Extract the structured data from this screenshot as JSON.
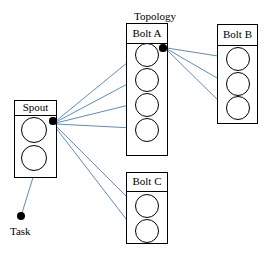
{
  "diagram": {
    "title": "Topology",
    "canvas": {
      "width": 271,
      "height": 256
    },
    "colors": {
      "stroke": "#000000",
      "arrow": "#4a7fb5",
      "background": "#ffffff",
      "port": "#000000"
    },
    "nodes": [
      {
        "id": "spout",
        "label": "Spout",
        "type": "spout",
        "box": {
          "x": 14,
          "y": 100,
          "w": 43,
          "h": 78
        },
        "header_h": 14,
        "slots": 2,
        "slot_positions": [
          {
            "cx": 34,
            "cy": 130,
            "r": 13
          },
          {
            "cx": 34,
            "cy": 158,
            "r": 13
          }
        ],
        "port": {
          "cx": 53,
          "cy": 121,
          "r": 3.6
        }
      },
      {
        "id": "bolt-a",
        "label": "Bolt A",
        "type": "bolt",
        "box": {
          "x": 126,
          "y": 23,
          "w": 42,
          "h": 133
        },
        "header_h": 19,
        "slots": 4,
        "slot_positions": [
          {
            "cx": 147,
            "cy": 55,
            "r": 12
          },
          {
            "cx": 147,
            "cy": 80,
            "r": 12
          },
          {
            "cx": 147,
            "cy": 105,
            "r": 12
          },
          {
            "cx": 147,
            "cy": 130,
            "r": 12
          }
        ],
        "port": {
          "cx": 163,
          "cy": 48,
          "r": 3.6
        }
      },
      {
        "id": "bolt-b",
        "label": "Bolt B",
        "type": "bolt",
        "box": {
          "x": 217,
          "y": 24,
          "w": 41,
          "h": 100
        },
        "header_h": 20,
        "slots": 3,
        "slot_positions": [
          {
            "cx": 238,
            "cy": 59,
            "r": 12
          },
          {
            "cx": 238,
            "cy": 84,
            "r": 12
          },
          {
            "cx": 238,
            "cy": 108,
            "r": 12
          }
        ],
        "port": null
      },
      {
        "id": "bolt-c",
        "label": "Bolt C",
        "type": "bolt",
        "box": {
          "x": 126,
          "y": 172,
          "w": 42,
          "h": 72
        },
        "header_h": 18,
        "slots": 2,
        "slot_positions": [
          {
            "cx": 147,
            "cy": 206,
            "r": 12
          },
          {
            "cx": 147,
            "cy": 231,
            "r": 12
          }
        ],
        "port": null
      }
    ],
    "task": {
      "label": "Task",
      "dot": {
        "cx": 21,
        "cy": 216,
        "r": 4.4
      },
      "label_pos": {
        "x": 10,
        "y": 226
      },
      "leader_from": {
        "x": 35,
        "y": 171
      },
      "leader_to": {
        "x": 22,
        "y": 213
      }
    },
    "title_pos": {
      "x": 124,
      "y": 11,
      "w": 62
    },
    "edges": [
      {
        "from": "spout-port",
        "to": "bolt-a-slot-1",
        "x1": 56,
        "y1": 121,
        "x2": 133,
        "y2": 58
      },
      {
        "from": "spout-port",
        "to": "bolt-a-slot-2",
        "x1": 56,
        "y1": 122,
        "x2": 133,
        "y2": 81
      },
      {
        "from": "spout-port",
        "to": "bolt-a-slot-3",
        "x1": 56,
        "y1": 123,
        "x2": 133,
        "y2": 104
      },
      {
        "from": "spout-port",
        "to": "bolt-a-slot-4",
        "x1": 56,
        "y1": 124,
        "x2": 133,
        "y2": 128
      },
      {
        "from": "spout-port",
        "to": "bolt-c-slot-1",
        "x1": 56,
        "y1": 126,
        "x2": 133,
        "y2": 203
      },
      {
        "from": "spout-port",
        "to": "bolt-c-slot-2",
        "x1": 56,
        "y1": 128,
        "x2": 133,
        "y2": 228
      },
      {
        "from": "bolt-a-port",
        "to": "bolt-b-slot-1",
        "x1": 167,
        "y1": 48,
        "x2": 224,
        "y2": 57
      },
      {
        "from": "bolt-a-port",
        "to": "bolt-b-slot-2",
        "x1": 167,
        "y1": 49,
        "x2": 224,
        "y2": 82
      },
      {
        "from": "bolt-a-port",
        "to": "bolt-b-slot-3",
        "x1": 167,
        "y1": 50,
        "x2": 224,
        "y2": 106
      }
    ]
  }
}
